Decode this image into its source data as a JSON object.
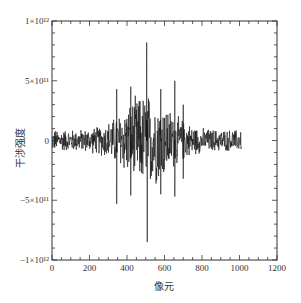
{
  "chart_data": {
    "type": "line",
    "title": "",
    "xlabel": "像元",
    "ylabel": "干涉强度",
    "xlim": [
      0,
      1200
    ],
    "ylim": [
      -1000000000000.0,
      1000000000000.0
    ],
    "x_ticks": [
      0,
      200,
      400,
      600,
      800,
      1000,
      1200
    ],
    "x_tick_labels": [
      "0",
      "200",
      "400",
      "600",
      "800",
      "1000",
      "1200"
    ],
    "y_ticks": [
      -1000000000000.0,
      -500000000000.0,
      0,
      500000000000.0,
      1000000000000.0
    ],
    "y_tick_labels": [
      "−1×10¹²",
      "−5×10¹¹",
      "0",
      "5×10¹¹",
      "1×10¹²"
    ],
    "grid": false,
    "legend": null,
    "series": [
      {
        "name": "interferogram",
        "color": "#111111",
        "description": "Interferogram centered near pixel 505, spanning pixels 0–1010; baseline noise amplitude ~±1e11, envelope growing to ~±4e11 around 350–700, central burst peak ~+8.2e11 / −8.5e11",
        "x_range": [
          0,
          1010
        ],
        "center_x": 505,
        "max_value": 820000000000.0,
        "min_value": -850000000000.0,
        "key_spikes": [
          {
            "x": 345,
            "value": 430000000000.0
          },
          {
            "x": 345,
            "value": -530000000000.0
          },
          {
            "x": 420,
            "value": 450000000000.0
          },
          {
            "x": 420,
            "value": -460000000000.0
          },
          {
            "x": 505,
            "value": 820000000000.0
          },
          {
            "x": 508,
            "value": -850000000000.0
          },
          {
            "x": 580,
            "value": 430000000000.0
          },
          {
            "x": 580,
            "value": -450000000000.0
          },
          {
            "x": 655,
            "value": 500000000000.0
          },
          {
            "x": 655,
            "value": -470000000000.0
          },
          {
            "x": 700,
            "value": 300000000000.0
          },
          {
            "x": 700,
            "value": -320000000000.0
          }
        ]
      }
    ]
  },
  "axes": {
    "x_label": "像元",
    "y_label": "干涉强度"
  }
}
